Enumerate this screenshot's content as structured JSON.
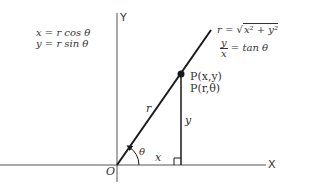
{
  "diagram": {
    "axes": {
      "x_label": "X",
      "y_label": "Y",
      "origin_label": "O"
    },
    "equations_left": {
      "line1": "x = r cos θ",
      "line2": "y = r sin θ"
    },
    "equations_right": {
      "r_lhs": "r = ",
      "r_radicand": "x² + y²",
      "tan_num": "y",
      "tan_den": "x",
      "tan_rhs": "= tan θ"
    },
    "point": {
      "cartesian": "P(x,y)",
      "polar": "P(r,θ)"
    },
    "segment_labels": {
      "r": "r",
      "x": "x",
      "y": "y",
      "theta": "θ"
    },
    "colors": {
      "stroke": "#1a1a1a",
      "axis": "#555555",
      "text": "#333333"
    }
  }
}
